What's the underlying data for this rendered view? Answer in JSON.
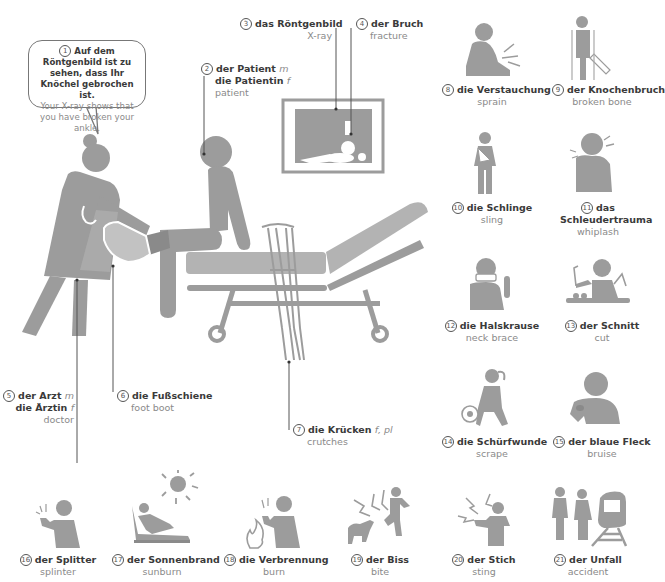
{
  "colors": {
    "figure": "#9c9c9c",
    "text_de": "#3a3a3a",
    "text_en": "#8a8a8a"
  },
  "speech_bubble": {
    "number": "1",
    "de": "Auf dem Röntgenbild ist zu sehen, dass Ihr Knöchel gebrochen ist.",
    "en": "Your X-ray shows that you have broken your ankle."
  },
  "scene_labels": [
    {
      "number": "2",
      "de": [
        "der Patient",
        "die Patientin"
      ],
      "gender": [
        "m",
        "f"
      ],
      "en": "patient"
    },
    {
      "number": "3",
      "de": [
        "das Röntgenbild"
      ],
      "gender": [
        ""
      ],
      "en": "X-ray"
    },
    {
      "number": "4",
      "de": [
        "der Bruch"
      ],
      "gender": [
        ""
      ],
      "en": "fracture"
    },
    {
      "number": "5",
      "de": [
        "der Arzt",
        "die Ärztin"
      ],
      "gender": [
        "m",
        "f"
      ],
      "en": "doctor"
    },
    {
      "number": "6",
      "de": [
        "die Fußschiene"
      ],
      "gender": [
        ""
      ],
      "en": "foot boot"
    },
    {
      "number": "7",
      "de": [
        "die Krücken"
      ],
      "gender": [
        "f, pl"
      ],
      "en": "crutches"
    }
  ],
  "items": [
    {
      "number": "8",
      "icon": "sprain-icon",
      "de": "die Verstauchung",
      "en": "sprain"
    },
    {
      "number": "9",
      "icon": "broken-bone-icon",
      "de": "der Knochenbruch",
      "en": "broken bone"
    },
    {
      "number": "10",
      "icon": "sling-icon",
      "de": "die Schlinge",
      "en": "sling"
    },
    {
      "number": "11",
      "icon": "whiplash-icon",
      "de": "das Schleudertrauma",
      "de_line1": "das",
      "de_line2": "Schleudertrauma",
      "en": "whiplash"
    },
    {
      "number": "12",
      "icon": "neck-brace-icon",
      "de": "die Halskrause",
      "en": "neck brace"
    },
    {
      "number": "13",
      "icon": "cut-icon",
      "de": "der Schnitt",
      "en": "cut"
    },
    {
      "number": "14",
      "icon": "scrape-icon",
      "de": "die Schürfwunde",
      "en": "scrape"
    },
    {
      "number": "15",
      "icon": "bruise-icon",
      "de": "der blaue Fleck",
      "en": "bruise"
    },
    {
      "number": "16",
      "icon": "splinter-icon",
      "de": "der Splitter",
      "en": "splinter"
    },
    {
      "number": "17",
      "icon": "sunburn-icon",
      "de": "der Sonnenbrand",
      "en": "sunburn"
    },
    {
      "number": "18",
      "icon": "burn-icon",
      "de": "die Verbrennung",
      "en": "burn"
    },
    {
      "number": "19",
      "icon": "bite-icon",
      "de": "der Biss",
      "en": "bite"
    },
    {
      "number": "20",
      "icon": "sting-icon",
      "de": "der Stich",
      "en": "sting"
    },
    {
      "number": "21",
      "icon": "accident-icon",
      "de": "der Unfall",
      "en": "accident"
    }
  ]
}
